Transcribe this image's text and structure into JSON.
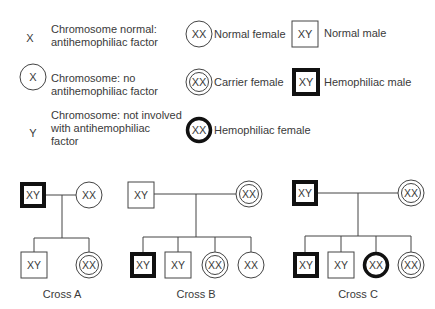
{
  "legend": {
    "x_label": "X",
    "x_desc_1": "Chromosome normal:",
    "x_desc_2": "antihemophiliac  factor",
    "xo_label": "X",
    "xo_desc_1": "Chromosome: no",
    "xo_desc_2": "antihemophiliac  factor",
    "y_label": "Y",
    "y_desc_1": "Chromosome: not involved",
    "y_desc_2": "with antihemophiliac",
    "y_desc_3": "factor",
    "normal_female_sym": "XX",
    "normal_female": "Normal female",
    "carrier_female_sym": "XX",
    "carrier_female": "Carrier female",
    "hemo_female_sym": "XX",
    "hemo_female": "Hemophiliac  female",
    "normal_male_sym": "XY",
    "normal_male": "Normal male",
    "hemo_male_sym": "XY",
    "hemo_male": "Hemophiliac  male"
  },
  "crosses": [
    {
      "label": "Cross A",
      "father": "XY",
      "mother": "XX",
      "children": [
        "XY",
        "XX"
      ]
    },
    {
      "label": "Cross B",
      "father": "XY",
      "mother": "XX",
      "children": [
        "XY",
        "XY",
        "XX",
        "XX"
      ]
    },
    {
      "label": "Cross C",
      "father": "XY",
      "mother": "XX",
      "children": [
        "XY",
        "XY",
        "XX",
        "XX"
      ]
    }
  ]
}
